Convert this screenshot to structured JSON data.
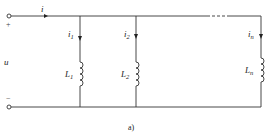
{
  "figure": {
    "caption": "a)",
    "type": "parallel inductor circuit"
  },
  "source": {
    "voltage_label": "u",
    "plus_sign": "+",
    "minus_sign": "−",
    "current_label": "i"
  },
  "branches": [
    {
      "current_symbol": "i",
      "current_sub": "1",
      "inductor_symbol": "L",
      "inductor_sub": "1"
    },
    {
      "current_symbol": "i",
      "current_sub": "2",
      "inductor_symbol": "L",
      "inductor_sub": "2"
    },
    {
      "current_symbol": "i",
      "current_sub": "n",
      "inductor_symbol": "L",
      "inductor_sub": "n"
    }
  ],
  "ellipsis": "- - -",
  "colors": {
    "wire": "#333333",
    "text": "#222222",
    "background": "#ffffff"
  }
}
